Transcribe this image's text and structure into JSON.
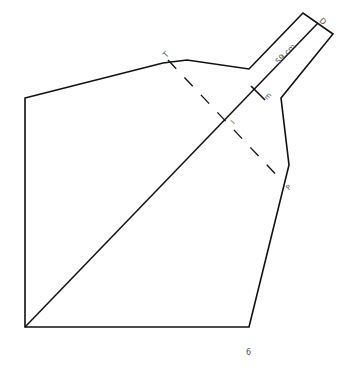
{
  "diagram": {
    "type": "geometry-figure",
    "stroke_color": "#111111",
    "label_color": "#555555",
    "labels": {
      "top_left_point": "T",
      "neck_length": "59 cm",
      "neck_end": "D",
      "tick_mark": "m",
      "intersection": "I",
      "right_point": "P",
      "bottom_label": "6"
    },
    "shape_vertices": [
      [
        25,
        98
      ],
      [
        163,
        63
      ],
      [
        187,
        60
      ],
      [
        249,
        69
      ],
      [
        303,
        13
      ],
      [
        333,
        34
      ],
      [
        281,
        98
      ],
      [
        289,
        165
      ],
      [
        249,
        327
      ],
      [
        25,
        327
      ]
    ],
    "diagonal": {
      "from": [
        25,
        327
      ],
      "to": [
        318,
        23
      ]
    },
    "dashed_segment": {
      "from": [
        168,
        60
      ],
      "to": [
        283,
        182
      ]
    },
    "tick": {
      "from": [
        252,
        100
      ],
      "to": [
        265,
        87
      ]
    }
  }
}
